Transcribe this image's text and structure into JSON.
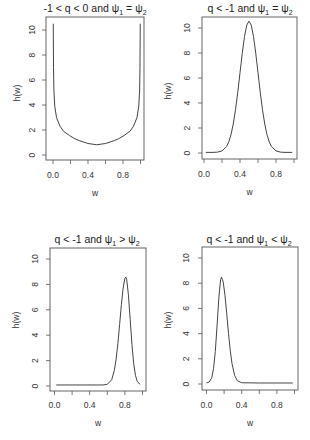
{
  "figure": {
    "background": "#ffffff",
    "line_color": "#444444",
    "layout": "2x2 grid of line plots"
  },
  "chart_data": [
    {
      "type": "line",
      "title": "-1 < q < 0 and ψ₁ = ψ₂",
      "title_parts": [
        {
          "t": "-1 < q < 0 and ψ"
        },
        {
          "sub": "1"
        },
        {
          "t": " = ψ"
        },
        {
          "sub": "2"
        }
      ],
      "xlabel": "w",
      "ylabel": "h(w)",
      "xlim": [
        0,
        1
      ],
      "ylim": [
        0,
        10.5
      ],
      "xticks": [
        0,
        0.2,
        0.4,
        0.6,
        0.8,
        1.0
      ],
      "xtick_labels": [
        "0.0",
        "",
        "0.4",
        "",
        "0.8",
        ""
      ],
      "yticks": [
        0,
        2,
        4,
        6,
        8,
        10
      ],
      "ytick_labels": [
        "0",
        "2",
        "4",
        "6",
        "8",
        "10"
      ],
      "grid": false,
      "legend": null,
      "series": [
        {
          "name": "h(w)",
          "x": [
            0.003,
            0.006,
            0.01,
            0.02,
            0.04,
            0.08,
            0.12,
            0.19,
            0.25,
            0.3,
            0.4,
            0.5,
            0.6,
            0.7,
            0.75,
            0.81,
            0.88,
            0.92,
            0.96,
            0.98,
            0.99,
            0.994,
            0.997
          ],
          "y": [
            10.5,
            7.0,
            5.2,
            3.9,
            3.0,
            2.3,
            1.9,
            1.55,
            1.3,
            1.15,
            0.92,
            0.82,
            0.92,
            1.15,
            1.3,
            1.55,
            1.9,
            2.3,
            3.0,
            3.9,
            5.2,
            7.0,
            10.5
          ]
        }
      ]
    },
    {
      "type": "line",
      "title": "q < -1 and ψ₁ = ψ₂",
      "title_parts": [
        {
          "t": "q < -1 and ψ"
        },
        {
          "sub": "1"
        },
        {
          "t": " = ψ"
        },
        {
          "sub": "2"
        }
      ],
      "xlabel": "w",
      "ylabel": "h(w)",
      "xlim": [
        0,
        1
      ],
      "ylim": [
        0,
        10.5
      ],
      "xticks": [
        0,
        0.2,
        0.4,
        0.6,
        0.8,
        1.0
      ],
      "xtick_labels": [
        "0.0",
        "",
        "0.4",
        "",
        "0.8",
        ""
      ],
      "yticks": [
        0,
        2,
        4,
        6,
        8,
        10
      ],
      "ytick_labels": [
        "0",
        "2",
        "4",
        "6",
        "8",
        "10"
      ],
      "grid": false,
      "legend": null,
      "series": [
        {
          "name": "h(w)",
          "x": [
            0.02,
            0.1,
            0.15,
            0.2,
            0.25,
            0.275,
            0.3,
            0.325,
            0.35,
            0.375,
            0.4,
            0.425,
            0.45,
            0.475,
            0.5,
            0.525,
            0.55,
            0.575,
            0.6,
            0.625,
            0.65,
            0.675,
            0.7,
            0.725,
            0.75,
            0.8,
            0.85,
            0.9,
            0.98
          ],
          "y": [
            0.05,
            0.05,
            0.07,
            0.17,
            0.51,
            0.89,
            1.47,
            2.32,
            3.46,
            4.86,
            6.42,
            7.98,
            9.32,
            10.23,
            10.55,
            10.23,
            9.32,
            7.98,
            6.42,
            4.86,
            3.46,
            2.32,
            1.47,
            0.89,
            0.51,
            0.17,
            0.07,
            0.05,
            0.05
          ]
        }
      ]
    },
    {
      "type": "line",
      "title": "q < -1 and ψ₁ > ψ₂",
      "title_parts": [
        {
          "t": "q < -1 and ψ"
        },
        {
          "sub": "1"
        },
        {
          "t": " > ψ"
        },
        {
          "sub": "2"
        }
      ],
      "xlabel": "w",
      "ylabel": "h(w)",
      "xlim": [
        0,
        1
      ],
      "ylim": [
        0,
        10.5
      ],
      "xticks": [
        0,
        0.2,
        0.4,
        0.6,
        0.8,
        1.0
      ],
      "xtick_labels": [
        "0.0",
        "",
        "0.4",
        "",
        "0.8",
        ""
      ],
      "yticks": [
        0,
        2,
        4,
        6,
        8,
        10
      ],
      "ytick_labels": [
        "0",
        "2",
        "4",
        "6",
        "8",
        "10"
      ],
      "grid": false,
      "legend": null,
      "series": [
        {
          "name": "h(w)",
          "x": [
            0.02,
            0.3,
            0.5,
            0.55,
            0.6,
            0.65,
            0.68,
            0.7,
            0.72,
            0.74,
            0.76,
            0.78,
            0.8,
            0.81,
            0.82,
            0.84,
            0.86,
            0.88,
            0.9,
            0.92,
            0.94,
            0.97
          ],
          "y": [
            0.08,
            0.08,
            0.08,
            0.08,
            0.13,
            0.49,
            1.23,
            2.11,
            3.34,
            4.84,
            6.4,
            7.72,
            8.48,
            8.58,
            8.41,
            7.18,
            5.24,
            3.27,
            1.76,
            0.84,
            0.37,
            0.13
          ]
        }
      ]
    },
    {
      "type": "line",
      "title": "q < -1 and ψ₁ < ψ₂",
      "title_parts": [
        {
          "t": "q < -1 and ψ"
        },
        {
          "sub": "1"
        },
        {
          "t": " < ψ"
        },
        {
          "sub": "2"
        }
      ],
      "xlabel": "w",
      "ylabel": "h(w)",
      "xlim": [
        0,
        1
      ],
      "ylim": [
        0,
        10.5
      ],
      "xticks": [
        0,
        0.2,
        0.4,
        0.6,
        0.8,
        1.0
      ],
      "xtick_labels": [
        "0.0",
        "",
        "0.4",
        "",
        "0.8",
        ""
      ],
      "yticks": [
        0,
        2,
        4,
        6,
        8,
        10
      ],
      "ytick_labels": [
        "0",
        "2",
        "4",
        "6",
        "8",
        "10"
      ],
      "grid": false,
      "legend": null,
      "series": [
        {
          "name": "h(w)",
          "x": [
            0.0,
            0.03,
            0.06,
            0.08,
            0.1,
            0.12,
            0.14,
            0.16,
            0.17,
            0.19,
            0.21,
            0.23,
            0.25,
            0.27,
            0.29,
            0.32,
            0.35,
            0.4,
            0.6,
            0.98
          ],
          "y": [
            0.09,
            0.15,
            0.5,
            1.22,
            2.58,
            4.61,
            6.81,
            8.28,
            8.48,
            8.09,
            7.04,
            5.57,
            4.02,
            2.65,
            1.61,
            0.67,
            0.26,
            0.1,
            0.08,
            0.08
          ]
        }
      ]
    }
  ]
}
